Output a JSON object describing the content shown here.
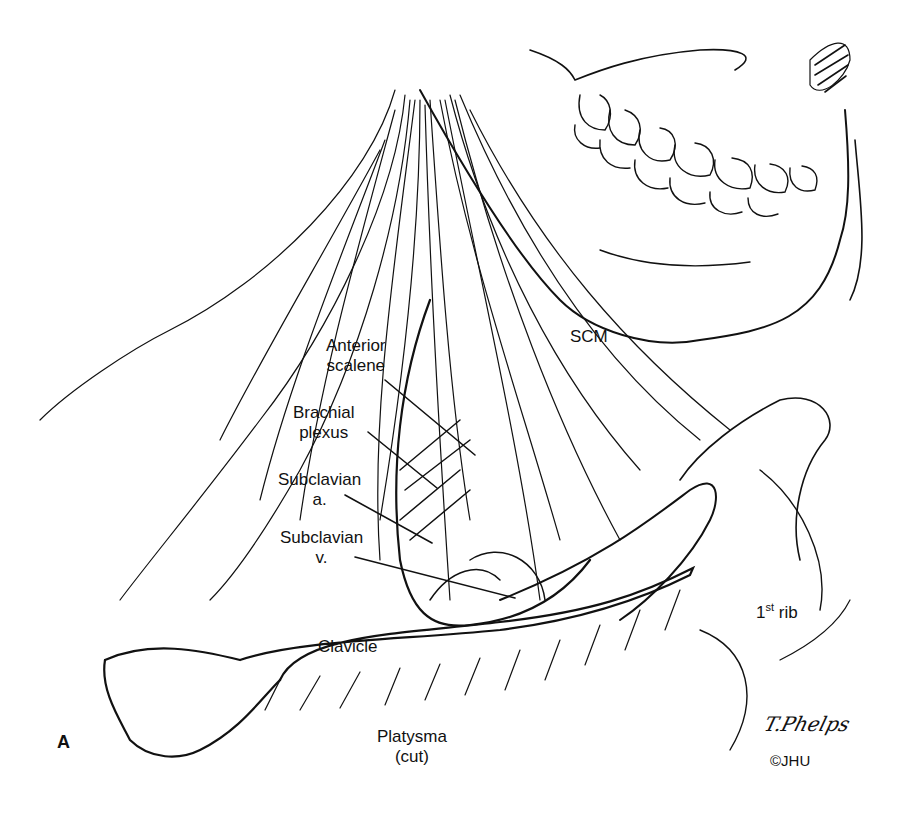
{
  "figure": {
    "panel_label": "A",
    "signature": "T.Phelps",
    "copyright": "©JHU"
  },
  "labels": {
    "scm": "SCM",
    "anterior_scalene": {
      "line1": "Anterior",
      "line2": "scalene"
    },
    "brachial_plexus": {
      "line1": "Brachial",
      "line2": "plexus"
    },
    "subclavian_a": {
      "line1": "Subclavian",
      "line2": "a."
    },
    "subclavian_v": {
      "line1": "Subclavian",
      "line2": "v."
    },
    "first_rib": {
      "num": "1",
      "sup": "st",
      "text": " rib"
    },
    "clavicle": "Clavicle",
    "platysma": {
      "line1": "Platysma",
      "line2": "(cut)"
    }
  },
  "colors": {
    "ink": "#111111",
    "background": "#ffffff"
  }
}
